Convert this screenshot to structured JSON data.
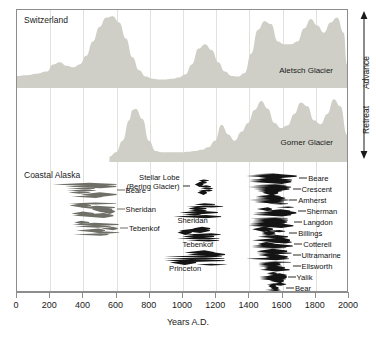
{
  "figure": {
    "xlabel": "Years A.D.",
    "vertical_axis": {
      "top_label": "Advance",
      "bottom_label": "Retreat"
    }
  },
  "axis": {
    "ticks": [
      0,
      200,
      400,
      600,
      800,
      1000,
      1200,
      1400,
      1600,
      1800,
      2000
    ],
    "tick_labels": [
      "0",
      "200",
      "400",
      "600",
      "800",
      "1000",
      "1200",
      "1400",
      "1600",
      "1800",
      "2000"
    ]
  },
  "panels": {
    "swiss": {
      "title": "Switzerland",
      "curve_label": "Aletsch Glacier"
    },
    "gorner": {
      "curve_label": "Gorner Glacier"
    },
    "alaska": {
      "title": "Coastal Alaska"
    }
  },
  "colors": {
    "swiss_fill": "#cfcfc7",
    "alaska_dark": "#141414",
    "alaska_gray": "#6f6f68",
    "frame": "#8d8d8d",
    "gridline": "#e2e2dc",
    "background": "#ffffff"
  },
  "chart_data": {
    "type": "area",
    "xlabel": "Years A.D.",
    "ylabel": "Advance / Retreat",
    "xlim": [
      0,
      2000
    ],
    "grid": true,
    "legend": "none",
    "series": [
      {
        "name": "Aletsch Glacier",
        "region": "Switzerland",
        "type": "area",
        "fill": "#cfcfc7",
        "comment": "Relative glacier extent; higher = advance",
        "x": [
          0,
          60,
          120,
          180,
          220,
          260,
          300,
          340,
          380,
          420,
          460,
          500,
          540,
          580,
          620,
          660,
          700,
          740,
          780,
          820,
          860,
          900,
          940,
          980,
          1020,
          1060,
          1100,
          1140,
          1180,
          1220,
          1260,
          1300,
          1340,
          1380,
          1420,
          1460,
          1500,
          1540,
          1580,
          1620,
          1660,
          1700,
          1740,
          1780,
          1820,
          1860,
          1900,
          1940,
          1980,
          2000
        ],
        "y": [
          0.14,
          0.15,
          0.17,
          0.2,
          0.3,
          0.33,
          0.28,
          0.26,
          0.3,
          0.42,
          0.62,
          0.82,
          0.95,
          0.97,
          0.88,
          0.66,
          0.4,
          0.22,
          0.13,
          0.1,
          0.09,
          0.09,
          0.1,
          0.12,
          0.16,
          0.3,
          0.52,
          0.58,
          0.5,
          0.33,
          0.2,
          0.14,
          0.13,
          0.18,
          0.45,
          0.78,
          0.9,
          0.86,
          0.62,
          0.58,
          0.58,
          0.62,
          0.8,
          0.93,
          0.84,
          0.74,
          0.88,
          0.95,
          0.74,
          0.3
        ]
      },
      {
        "name": "Gorner Glacier",
        "region": "Switzerland",
        "type": "area",
        "fill": "#cfcfc7",
        "comment": "Record begins near 560 A.D.",
        "x": [
          560,
          600,
          640,
          680,
          700,
          720,
          760,
          800,
          840,
          880,
          920,
          960,
          1000,
          1040,
          1080,
          1120,
          1160,
          1200,
          1240,
          1280,
          1320,
          1360,
          1400,
          1440,
          1480,
          1520,
          1560,
          1600,
          1640,
          1680,
          1720,
          1760,
          1800,
          1840,
          1880,
          1920,
          1960,
          2000
        ],
        "y": [
          0.05,
          0.12,
          0.3,
          0.62,
          0.78,
          0.8,
          0.64,
          0.3,
          0.14,
          0.12,
          0.12,
          0.12,
          0.12,
          0.13,
          0.14,
          0.16,
          0.2,
          0.3,
          0.55,
          0.4,
          0.3,
          0.44,
          0.58,
          0.78,
          0.92,
          0.8,
          0.58,
          0.5,
          0.54,
          0.72,
          0.9,
          0.84,
          0.62,
          0.56,
          0.72,
          0.95,
          0.84,
          0.4
        ]
      }
    ],
    "alaska_records": [
      {
        "label": "Beare",
        "cluster": "left",
        "tone": "gray",
        "x_start": 210,
        "x_end": 600,
        "row": 0
      },
      {
        "label": "Sheridan",
        "cluster": "left",
        "tone": "gray",
        "x_start": 300,
        "x_end": 600,
        "row": 1
      },
      {
        "label": "Tebenkof",
        "cluster": "left",
        "tone": "gray",
        "x_start": 330,
        "x_end": 620,
        "row": 2
      },
      {
        "label": "Stellar Lobe (Bering Glacier)",
        "cluster": "middle",
        "tone": "dark",
        "x_start": 1040,
        "x_end": 1180,
        "row": 0
      },
      {
        "label": "Sheridan",
        "cluster": "middle",
        "tone": "dark",
        "x_start": 930,
        "x_end": 1260,
        "row": 1
      },
      {
        "label": "Tebenkof",
        "cluster": "middle",
        "tone": "dark",
        "x_start": 960,
        "x_end": 1230,
        "row": 2
      },
      {
        "label": "Princeton",
        "cluster": "middle",
        "tone": "dark",
        "x_start": 880,
        "x_end": 1270,
        "row": 3
      },
      {
        "label": "Beare",
        "cluster": "right",
        "tone": "dark",
        "x_start": 1380,
        "x_end": 1700,
        "row": 0
      },
      {
        "label": "Crescent",
        "cluster": "right",
        "tone": "dark",
        "x_start": 1390,
        "x_end": 1660,
        "row": 1
      },
      {
        "label": "Amherst",
        "cluster": "right",
        "tone": "dark",
        "x_start": 1400,
        "x_end": 1640,
        "row": 2
      },
      {
        "label": "Sherman",
        "cluster": "right",
        "tone": "dark",
        "x_start": 1400,
        "x_end": 1690,
        "row": 3
      },
      {
        "label": "Langdon",
        "cluster": "right",
        "tone": "dark",
        "x_start": 1390,
        "x_end": 1670,
        "row": 4
      },
      {
        "label": "Billings",
        "cluster": "right",
        "tone": "dark",
        "x_start": 1410,
        "x_end": 1640,
        "row": 5
      },
      {
        "label": "Cotterell",
        "cluster": "right",
        "tone": "dark",
        "x_start": 1400,
        "x_end": 1670,
        "row": 6
      },
      {
        "label": "Ultramarine",
        "cluster": "right",
        "tone": "dark",
        "x_start": 1380,
        "x_end": 1660,
        "row": 7
      },
      {
        "label": "Ellsworth",
        "cluster": "right",
        "tone": "dark",
        "x_start": 1440,
        "x_end": 1660,
        "row": 8
      },
      {
        "label": "Yalik",
        "cluster": "right",
        "tone": "dark",
        "x_start": 1460,
        "x_end": 1630,
        "row": 9
      },
      {
        "label": "Bear",
        "cluster": "right",
        "tone": "dark",
        "x_start": 1480,
        "x_end": 1620,
        "row": 10
      }
    ]
  }
}
